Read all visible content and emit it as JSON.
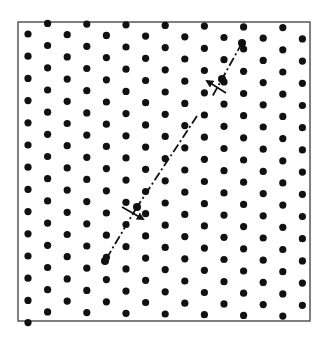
{
  "figure": {
    "width": 327,
    "height": 339,
    "background": "#ffffff",
    "frame": {
      "x": 18,
      "y": 22,
      "width": 292,
      "height": 299,
      "stroke": "#555555",
      "stroke_width": 1.5
    },
    "lattice": {
      "type": "hexagonal",
      "dot_color": "#111111",
      "dot_radius": 3.6,
      "x0": 28,
      "dx": 19.6,
      "columns": 15,
      "dy": 22.2,
      "even_col_y0": 34,
      "odd_col_y0": 23,
      "skew_per_col": 0.35,
      "y_min": 21,
      "y_max": 323
    },
    "slip_line": {
      "style": "dash-dot",
      "color": "#111111",
      "width": 1.8,
      "segments": [
        {
          "from": [
            242,
            43
          ],
          "to": [
            212,
            97
          ]
        },
        {
          "from": [
            197,
            116
          ],
          "to": [
            137,
            207
          ]
        },
        {
          "from": [
            137,
            207
          ],
          "to": [
            105,
            261
          ]
        }
      ]
    },
    "arrows": [
      {
        "name": "upper-burgers-arrow",
        "tail": [
          226,
          93
        ],
        "head": [
          207,
          81
        ],
        "color": "#111111"
      },
      {
        "name": "lower-burgers-arrow",
        "tail": [
          122,
          207
        ],
        "head": [
          143,
          219
        ],
        "color": "#111111"
      }
    ],
    "endpoint_dots": [
      {
        "name": "top-endpoint-atom",
        "x": 242,
        "y": 43
      },
      {
        "name": "upper-arrow-atom",
        "x": 222,
        "y": 79
      },
      {
        "name": "lower-arrow-atom",
        "x": 137,
        "y": 207
      },
      {
        "name": "bottom-endpoint-atom",
        "x": 105,
        "y": 261
      }
    ]
  }
}
